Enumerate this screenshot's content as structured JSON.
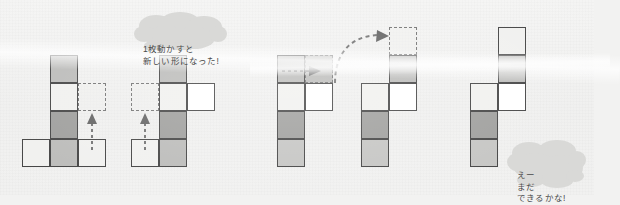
{
  "page": {
    "title": "1枚動かすと新しい形になった!",
    "background_color": "#f1f1f0",
    "cell_colors": {
      "pale": "#f0f0ee",
      "white": "#ffffff",
      "mid": "#b9b9b7",
      "mid_light": "#c3c3c1",
      "dark": "#9b9b99",
      "outline": "#3c3c3c",
      "ghost_outline": "#6e6e6e"
    }
  },
  "bubbles": [
    {
      "id": "bubble-top",
      "text": "1枚動かすと\n新しい形になった!",
      "line1": "1枚動かすと",
      "line2": "新しい形になった!"
    },
    {
      "id": "bubble-bottom",
      "text": "えー\nまだ\nできるかな!",
      "line1": "えー",
      "line2": "まだ",
      "line3": "できるかな!"
    }
  ],
  "figures": [
    {
      "id": "figure-1",
      "label": "shape-step-1",
      "cells": [
        {
          "col": 1,
          "row": 0,
          "fill": "mid"
        },
        {
          "col": 1,
          "row": 1,
          "fill": "pale"
        },
        {
          "col": 1,
          "row": 2,
          "fill": "dark"
        },
        {
          "col": 0,
          "row": 3,
          "fill": "pale"
        },
        {
          "col": 1,
          "row": 3,
          "fill": "mid"
        },
        {
          "col": 2,
          "row": 3,
          "fill": "pale"
        }
      ],
      "ghost_cells": [
        {
          "col": 2,
          "row": 1,
          "fill": "ghost"
        }
      ],
      "arrows": [
        {
          "type": "arrow-up",
          "name": "move-arrow-up"
        }
      ]
    },
    {
      "id": "figure-2",
      "label": "shape-step-2",
      "cells": [
        {
          "col": 1,
          "row": 0,
          "fill": "mid"
        },
        {
          "col": 1,
          "row": 1,
          "fill": "pale"
        },
        {
          "col": 2,
          "row": 1,
          "fill": "white"
        },
        {
          "col": 1,
          "row": 2,
          "fill": "dark"
        },
        {
          "col": 0,
          "row": 3,
          "fill": "pale"
        },
        {
          "col": 1,
          "row": 3,
          "fill": "mid"
        }
      ],
      "ghost_cells": [
        {
          "col": 0,
          "row": 1,
          "fill": "ghost"
        }
      ],
      "arrows": [
        {
          "type": "arrow-up",
          "name": "move-arrow-up"
        }
      ]
    },
    {
      "id": "figure-3",
      "label": "shape-step-3",
      "cells": [
        {
          "col": 0,
          "row": 0,
          "fill": "mid"
        },
        {
          "col": 0,
          "row": 1,
          "fill": "pale"
        },
        {
          "col": 1,
          "row": 1,
          "fill": "white"
        },
        {
          "col": 0,
          "row": 2,
          "fill": "dark"
        },
        {
          "col": 0,
          "row": 3,
          "fill": "midlt"
        }
      ],
      "ghost_cells": [
        {
          "col": 1,
          "row": 0,
          "fill": "ghost mid"
        }
      ],
      "arrows": [
        {
          "type": "arrow-right",
          "name": "move-arrow-right"
        }
      ]
    },
    {
      "id": "figure-4",
      "label": "shape-step-4",
      "cells": [
        {
          "col": 1,
          "row": 1,
          "fill": "mid"
        },
        {
          "col": 0,
          "row": 2,
          "fill": "pale"
        },
        {
          "col": 1,
          "row": 2,
          "fill": "white"
        },
        {
          "col": 0,
          "row": 3,
          "fill": "dark"
        },
        {
          "col": 0,
          "row": 4,
          "fill": "midlt"
        }
      ],
      "ghost_cells": [
        {
          "col": 1,
          "row": 0,
          "fill": "ghost"
        }
      ],
      "arrows": [
        {
          "type": "arrow-curve",
          "name": "move-arrow-curved"
        }
      ]
    },
    {
      "id": "figure-5",
      "label": "shape-step-5",
      "cells": [
        {
          "col": 1,
          "row": 0,
          "fill": "pale"
        },
        {
          "col": 1,
          "row": 1,
          "fill": "mid"
        },
        {
          "col": 0,
          "row": 2,
          "fill": "pale"
        },
        {
          "col": 1,
          "row": 2,
          "fill": "white"
        },
        {
          "col": 0,
          "row": 3,
          "fill": "dark"
        },
        {
          "col": 0,
          "row": 4,
          "fill": "midlt"
        }
      ],
      "ghost_cells": [],
      "arrows": []
    }
  ]
}
